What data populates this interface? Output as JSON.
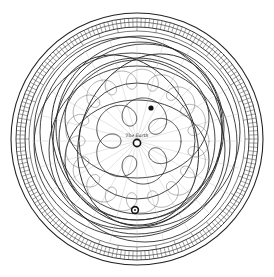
{
  "diagram": {
    "type": "geocentric planetary orbit engraving",
    "center_label": "The Earth",
    "colors": {
      "ink": "#1a1a1a",
      "paper": "#ffffff",
      "faint": "#9a9a9a"
    },
    "bodies": [
      {
        "name": "Earth",
        "symbol": "earth-icon",
        "x": 137,
        "y": 141
      },
      {
        "name": "Planet",
        "symbol": "planet-icon",
        "x": 151,
        "y": 108
      },
      {
        "name": "Sun",
        "symbol": "sun-icon",
        "x": 135,
        "y": 210
      }
    ],
    "rings": {
      "outer_radius": 125,
      "count": 4,
      "graduated": true
    },
    "rosette": {
      "lobes": 5,
      "loop_count": 5
    }
  }
}
